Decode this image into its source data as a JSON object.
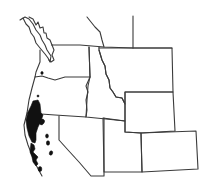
{
  "map": {
    "type": "species range map",
    "region": "Western North America",
    "colors": {
      "background": "#ffffff",
      "borders": "#3a3a3a",
      "range_fill": "#111111"
    },
    "regions_outlined": [
      "British Columbia coast",
      "Washington",
      "Oregon",
      "California",
      "Nevada",
      "Idaho",
      "Montana",
      "Wyoming",
      "Utah",
      "Colorado"
    ],
    "range_description": "Shaded distribution along the coast of northern California and extreme southwestern Oregon, with scattered outlying patches in the Sierra Nevada / Coast Ranges"
  }
}
